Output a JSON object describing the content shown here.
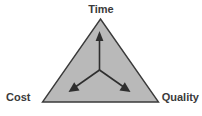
{
  "diagram": {
    "type": "project-management-triangle",
    "title": "",
    "vertices": [
      {
        "id": "time",
        "label": "Time",
        "position": "top"
      },
      {
        "id": "cost",
        "label": "Cost",
        "position": "bottom-left"
      },
      {
        "id": "quality",
        "label": "Quality",
        "position": "bottom-right"
      }
    ],
    "arrows": [
      {
        "id": "arrow-up",
        "from": "center",
        "to": "time",
        "direction": "up"
      },
      {
        "id": "arrow-down-left",
        "from": "center",
        "to": "cost",
        "direction": "down-left"
      },
      {
        "id": "arrow-down-right",
        "from": "center",
        "to": "quality",
        "direction": "down-right"
      }
    ],
    "colors": {
      "background": "#ffffff",
      "triangle_fill": "#b9b9b9",
      "triangle_stroke": "#3a3a3a",
      "arrow": "#2e2e2e",
      "label_text": "#3a3a3a"
    }
  }
}
